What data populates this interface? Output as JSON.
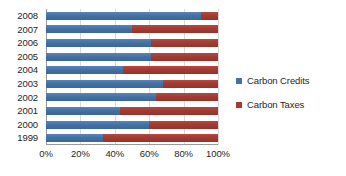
{
  "chart_data": {
    "type": "bar",
    "subtype": "stacked-bar-horizontal-100pct",
    "title": "",
    "xlabel": "",
    "ylabel": "",
    "categories": [
      "2008",
      "2007",
      "2006",
      "2005",
      "2004",
      "2003",
      "2002",
      "2001",
      "2000",
      "1999"
    ],
    "series": [
      {
        "name": "Carbon Credits",
        "color": "#4472a4",
        "values": [
          90,
          50,
          61,
          61,
          45,
          68,
          64,
          43,
          60,
          33
        ]
      },
      {
        "name": "Carbon Taxes",
        "color": "#a23b32",
        "values": [
          10,
          50,
          39,
          39,
          55,
          32,
          36,
          57,
          40,
          67
        ]
      }
    ],
    "xlim": [
      0,
      100
    ],
    "x_ticks": [
      0,
      20,
      40,
      60,
      80,
      100
    ],
    "x_tick_labels": [
      "0%",
      "20%",
      "40%",
      "60%",
      "80%",
      "100%"
    ],
    "grid": true,
    "grid_axis": "x",
    "legend": true,
    "legend_position": "right",
    "orientation": "horizontal"
  },
  "legend": {
    "items": [
      {
        "label": "Carbon Credits",
        "color": "#4472a4"
      },
      {
        "label": "Carbon Taxes",
        "color": "#a23b32"
      }
    ]
  },
  "colors": {
    "series_credits": "#4472a4",
    "series_taxes": "#a23b32",
    "gridline": "#d9d9d9",
    "axis": "#9a9a9a",
    "text": "#262626",
    "background": "#ffffff"
  }
}
